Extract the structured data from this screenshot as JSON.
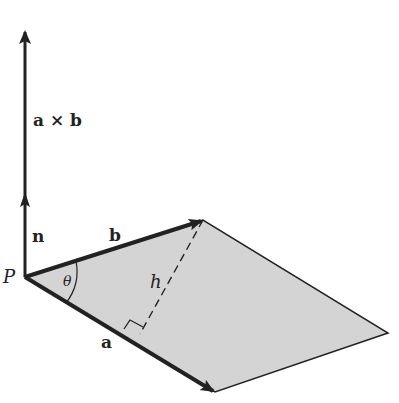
{
  "diagram": {
    "colors": {
      "stroke": "#222222",
      "fill": "#d4d4d4",
      "background": "#ffffff"
    },
    "points": {
      "P": [
        25,
        277
      ],
      "b_tip": [
        203,
        220
      ],
      "a_tip": [
        215,
        392
      ],
      "far_vertex": [
        388,
        333
      ],
      "n_tip": [
        25,
        192
      ],
      "axb_tip": [
        25,
        30
      ],
      "foot": [
        138,
        350
      ]
    },
    "labels": {
      "axb": "a × b",
      "n": "n",
      "b": "b",
      "P": "P",
      "theta": "θ",
      "h": "h",
      "a": "a"
    }
  }
}
